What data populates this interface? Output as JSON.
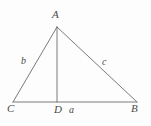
{
  "figure": {
    "type": "geometry-diagram",
    "background_color": "#fdfdfd",
    "stroke_color": "#6b6b6b",
    "label_color": "#4a4a4a",
    "stroke_width": 0.9,
    "canvas": {
      "width": 151,
      "height": 126
    },
    "points": {
      "A": {
        "x": 57,
        "y": 27,
        "label": "A"
      },
      "B": {
        "x": 137,
        "y": 102,
        "label": "B"
      },
      "C": {
        "x": 13,
        "y": 102,
        "label": "C"
      },
      "D": {
        "x": 57,
        "y": 102,
        "label": "D"
      }
    },
    "segments": [
      {
        "name": "side-CA",
        "from": "C",
        "to": "A"
      },
      {
        "name": "side-AB",
        "from": "A",
        "to": "B"
      },
      {
        "name": "base-CB",
        "from": "C",
        "to": "B"
      },
      {
        "name": "altitude-AD",
        "from": "A",
        "to": "D"
      }
    ],
    "side_labels": {
      "b": {
        "text": "b",
        "belongs_to": "side-CA"
      },
      "c": {
        "text": "c",
        "belongs_to": "side-AB"
      },
      "a": {
        "text": "a",
        "belongs_to": "base-DB"
      }
    }
  }
}
